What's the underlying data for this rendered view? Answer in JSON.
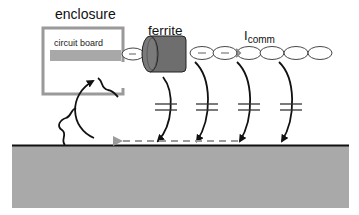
{
  "labels": {
    "enclosure": "enclosure",
    "circuit_board": "circuit board",
    "ferrite": "ferrite",
    "current_symbol": "I",
    "current_subscript": "comm"
  },
  "components": {
    "enclosure_box": {
      "shape": "open-sided rectangle",
      "color": "#9a9a9a"
    },
    "circuit_board": {
      "shape": "bar",
      "color": "#a8a8a8"
    },
    "ferrite_core": {
      "shape": "cylinder",
      "color": "#6e6e6e"
    },
    "cable_loops": {
      "count": 7,
      "shape": "oval chain"
    },
    "stray_capacitors": {
      "count": 4,
      "symbol": "capacitor"
    },
    "ground_plane": {
      "color": "#a9a9a9",
      "edge_color": "#111111"
    },
    "return_current_arrow": {
      "style": "dashed",
      "color": "#999999",
      "direction": "left"
    },
    "return_path_arrow": {
      "style": "curved",
      "color": "#111111",
      "direction": "up into enclosure"
    }
  },
  "colors": {
    "enclosure": "#9a9a9a",
    "board": "#a8a8a8",
    "ferrite": "#6e6e6e",
    "ground": "#a9a9a9",
    "line": "#111111",
    "dashed": "#9b9b9b"
  }
}
